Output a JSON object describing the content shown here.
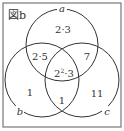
{
  "figure": {
    "label": "図b",
    "sets": [
      {
        "name": "a"
      },
      {
        "name": "b"
      },
      {
        "name": "c"
      }
    ],
    "regions": {
      "a_only": "2·3",
      "a_b": "2·5",
      "a_c": "7",
      "a_b_c_base": "2",
      "a_b_c_exp": "2",
      "a_b_c_rest": "·3",
      "b_only": "1",
      "b_c": "1",
      "c_only": "11"
    },
    "colors": {
      "line": "#333333",
      "frame": "#666666",
      "background": "#ffffff"
    }
  }
}
